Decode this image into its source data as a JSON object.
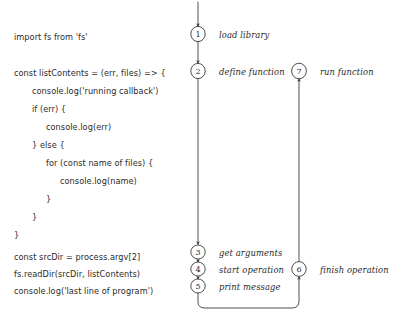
{
  "canvas": {
    "width": 396,
    "height": 328,
    "background": "#ffffff",
    "ink": "#3a3a3a"
  },
  "code": {
    "lines": [
      {
        "text": "import fs from 'fs'",
        "x": 14,
        "y": 32
      },
      {
        "text": "const listContents = (err, files) => {",
        "x": 14,
        "y": 68
      },
      {
        "text": "console.log('running callback')",
        "x": 32,
        "y": 86
      },
      {
        "text": "if (err) {",
        "x": 32,
        "y": 104
      },
      {
        "text": "console.log(err)",
        "x": 46,
        "y": 122
      },
      {
        "text": "} else {",
        "x": 32,
        "y": 140
      },
      {
        "text": "for (const name of files) {",
        "x": 46,
        "y": 158
      },
      {
        "text": "console.log(name)",
        "x": 60,
        "y": 176
      },
      {
        "text": "}",
        "x": 46,
        "y": 194
      },
      {
        "text": "}",
        "x": 32,
        "y": 212
      },
      {
        "text": "}",
        "x": 14,
        "y": 230
      },
      {
        "text": "const srcDir = process.argv[2]",
        "x": 14,
        "y": 252
      },
      {
        "text": "fs.readDir(srcDir, listContents)",
        "x": 14,
        "y": 269
      },
      {
        "text": "console.log('last line of program')",
        "x": 14,
        "y": 286
      }
    ]
  },
  "steps": [
    {
      "number": "1",
      "label": "load library",
      "cx": 198,
      "cy": 34,
      "label_x": 219,
      "label_y": 31
    },
    {
      "number": "2",
      "label": "define function",
      "cx": 198,
      "cy": 71,
      "label_x": 219,
      "label_y": 68
    },
    {
      "number": "3",
      "label": "get arguments",
      "cx": 198,
      "cy": 252,
      "label_x": 219,
      "label_y": 249
    },
    {
      "number": "4",
      "label": "start operation",
      "cx": 198,
      "cy": 269,
      "label_x": 219,
      "label_y": 266
    },
    {
      "number": "5",
      "label": "print message",
      "cx": 198,
      "cy": 286,
      "label_x": 219,
      "label_y": 283
    },
    {
      "number": "6",
      "label": "finish operation",
      "cx": 299,
      "cy": 269,
      "label_x": 320,
      "label_y": 266
    },
    {
      "number": "7",
      "label": "run function",
      "cx": 299,
      "cy": 71,
      "label_x": 320,
      "label_y": 68
    }
  ]
}
